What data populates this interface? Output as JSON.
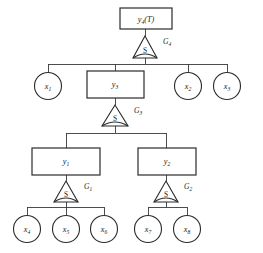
{
  "diagram": {
    "type": "hierarchical-and-or-tree",
    "title_text": "",
    "stroke_color": "#2b2b2b",
    "edge_color": "#3a3a3a",
    "background_color": "#ffffff",
    "levels": [
      {
        "level": 0,
        "nodes": [
          {
            "id": "y4",
            "shape": "box",
            "label": "y",
            "subscript": "4",
            "suffix": "(T)",
            "full_label": "y4(T)"
          }
        ]
      },
      {
        "level": 1,
        "operator": {
          "id": "G4",
          "symbol": "S",
          "label": "G",
          "subscript": "4",
          "full_label": "G4"
        }
      },
      {
        "level": 2,
        "nodes": [
          {
            "id": "x1",
            "shape": "circle",
            "label": "x",
            "subscript": "1",
            "full_label": "x1"
          },
          {
            "id": "y3",
            "shape": "box",
            "label": "y",
            "subscript": "3",
            "full_label": "y3"
          },
          {
            "id": "x2",
            "shape": "circle",
            "label": "x",
            "subscript": "2",
            "full_label": "x2"
          },
          {
            "id": "x3",
            "shape": "circle",
            "label": "x",
            "subscript": "3",
            "full_label": "x3"
          }
        ]
      },
      {
        "level": 3,
        "operator": {
          "id": "G3",
          "symbol": "S",
          "label": "G",
          "subscript": "3",
          "full_label": "G3"
        }
      },
      {
        "level": 4,
        "nodes": [
          {
            "id": "y1",
            "shape": "box",
            "label": "y",
            "subscript": "1",
            "full_label": "y1"
          },
          {
            "id": "y2",
            "shape": "box",
            "label": "y",
            "subscript": "2",
            "full_label": "y2"
          }
        ]
      },
      {
        "level": 5,
        "operators": [
          {
            "id": "G1",
            "symbol": "S",
            "label": "G",
            "subscript": "1",
            "full_label": "G1"
          },
          {
            "id": "G2",
            "symbol": "S",
            "label": "G",
            "subscript": "2",
            "full_label": "G2"
          }
        ]
      },
      {
        "level": 6,
        "nodes": [
          {
            "id": "x4",
            "shape": "circle",
            "label": "x",
            "subscript": "4",
            "full_label": "x4"
          },
          {
            "id": "x5",
            "shape": "circle",
            "label": "x",
            "subscript": "5",
            "full_label": "x5"
          },
          {
            "id": "x6",
            "shape": "circle",
            "label": "x",
            "subscript": "6",
            "full_label": "x6"
          },
          {
            "id": "x7",
            "shape": "circle",
            "label": "x",
            "subscript": "7",
            "full_label": "x7"
          },
          {
            "id": "x8",
            "shape": "circle",
            "label": "x",
            "subscript": "8",
            "full_label": "x8"
          }
        ]
      }
    ],
    "labels": {
      "y4_main": "y",
      "y4_sub": "4",
      "y4_suffix": "(T)",
      "y3_main": "y",
      "y3_sub": "3",
      "y2_main": "y",
      "y2_sub": "2",
      "y1_main": "y",
      "y1_sub": "1",
      "x1_main": "x",
      "x1_sub": "1",
      "x2_main": "x",
      "x2_sub": "2",
      "x3_main": "x",
      "x3_sub": "3",
      "x4_main": "x",
      "x4_sub": "4",
      "x5_main": "x",
      "x5_sub": "5",
      "x6_main": "x",
      "x6_sub": "6",
      "x7_main": "x",
      "x7_sub": "7",
      "x8_main": "x",
      "x8_sub": "8",
      "s_symbol": "S",
      "g1_main": "G",
      "g1_sub": "1",
      "g2_main": "G",
      "g2_sub": "2",
      "g3_main": "G",
      "g3_sub": "3",
      "g4_main": "G",
      "g4_sub": "4"
    }
  }
}
